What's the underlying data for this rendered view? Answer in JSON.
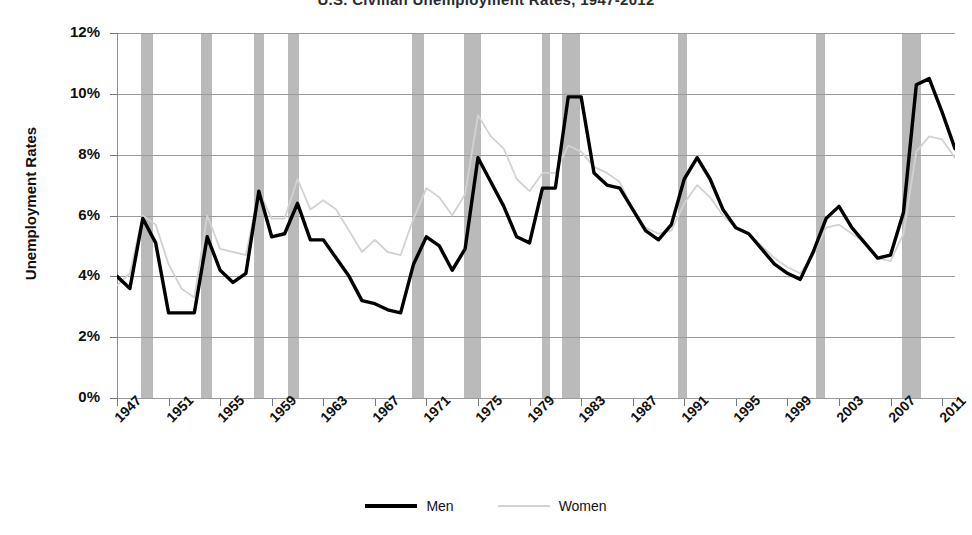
{
  "chart_data": {
    "type": "line",
    "title": "U.S. Civilian Unemployment Rates, 1947-2012",
    "xlabel": "",
    "ylabel": "Unemployment Rates",
    "ylim": [
      0,
      12
    ],
    "xlim": [
      1947,
      2012
    ],
    "grid": true,
    "legend_position": "bottom",
    "y_tick_labels": [
      "12%",
      "10%",
      "8%",
      "6%",
      "4%",
      "2%",
      "0%"
    ],
    "y_tick_values": [
      12,
      10,
      8,
      6,
      4,
      2,
      0
    ],
    "x_tick_labels": [
      "1947",
      "1951",
      "1955",
      "1959",
      "1963",
      "1967",
      "1971",
      "1975",
      "1979",
      "1983",
      "1987",
      "1991",
      "1995",
      "1999",
      "2003",
      "2007",
      "2011"
    ],
    "x_tick_values": [
      1947,
      1951,
      1955,
      1959,
      1963,
      1967,
      1971,
      1975,
      1979,
      1983,
      1987,
      1991,
      1995,
      1999,
      2003,
      2007,
      2011
    ],
    "x": [
      1947,
      1948,
      1949,
      1950,
      1951,
      1952,
      1953,
      1954,
      1955,
      1956,
      1957,
      1958,
      1959,
      1960,
      1961,
      1962,
      1963,
      1964,
      1965,
      1966,
      1967,
      1968,
      1969,
      1970,
      1971,
      1972,
      1973,
      1974,
      1975,
      1976,
      1977,
      1978,
      1979,
      1980,
      1981,
      1982,
      1983,
      1984,
      1985,
      1986,
      1987,
      1988,
      1989,
      1990,
      1991,
      1992,
      1993,
      1994,
      1995,
      1996,
      1997,
      1998,
      1999,
      2000,
      2001,
      2002,
      2003,
      2004,
      2005,
      2006,
      2007,
      2008,
      2009,
      2010,
      2011,
      2012
    ],
    "series": [
      {
        "name": "Men",
        "color": "#000000",
        "style": "thick-solid",
        "values": [
          4.0,
          3.6,
          5.9,
          5.1,
          2.8,
          2.8,
          2.8,
          5.3,
          4.2,
          3.8,
          4.1,
          6.8,
          5.3,
          5.4,
          6.4,
          5.2,
          5.2,
          4.6,
          4.0,
          3.2,
          3.1,
          2.9,
          2.8,
          4.4,
          5.3,
          5.0,
          4.2,
          4.9,
          7.9,
          7.1,
          6.3,
          5.3,
          5.1,
          6.9,
          6.9,
          9.9,
          9.9,
          7.4,
          7.0,
          6.9,
          6.2,
          5.5,
          5.2,
          5.7,
          7.2,
          7.9,
          7.2,
          6.2,
          5.6,
          5.4,
          4.9,
          4.4,
          4.1,
          3.9,
          4.8,
          5.9,
          6.3,
          5.6,
          5.1,
          4.6,
          4.7,
          6.1,
          10.3,
          10.5,
          9.4,
          8.2
        ]
      },
      {
        "name": "Women",
        "color": "#d2d2d2",
        "style": "thin-solid",
        "values": [
          3.7,
          4.1,
          6.0,
          5.7,
          4.4,
          3.6,
          3.3,
          6.0,
          4.9,
          4.8,
          4.7,
          6.8,
          5.9,
          5.9,
          7.2,
          6.2,
          6.5,
          6.2,
          5.5,
          4.8,
          5.2,
          4.8,
          4.7,
          5.9,
          6.9,
          6.6,
          6.0,
          6.7,
          9.3,
          8.6,
          8.2,
          7.2,
          6.8,
          7.4,
          7.4,
          8.3,
          8.1,
          7.6,
          7.4,
          7.1,
          6.2,
          5.6,
          5.4,
          5.5,
          6.4,
          7.0,
          6.6,
          6.0,
          5.6,
          5.4,
          5.0,
          4.6,
          4.3,
          4.1,
          4.7,
          5.6,
          5.7,
          5.4,
          5.1,
          4.6,
          4.5,
          5.4,
          8.1,
          8.6,
          8.5,
          7.9
        ]
      }
    ],
    "shaded_regions": {
      "name": "recession-bands",
      "color": "#b4b4b4",
      "periods": [
        [
          1948.9,
          1949.8
        ],
        [
          1953.5,
          1954.4
        ],
        [
          1957.6,
          1958.4
        ],
        [
          1960.3,
          1961.1
        ],
        [
          1969.9,
          1970.8
        ],
        [
          1973.9,
          1975.2
        ],
        [
          1980.0,
          1980.6
        ],
        [
          1981.5,
          1982.9
        ],
        [
          1990.5,
          1991.2
        ],
        [
          2001.2,
          2001.9
        ],
        [
          2007.9,
          2009.4
        ]
      ]
    }
  },
  "legend": {
    "items": [
      {
        "label": "Men"
      },
      {
        "label": "Women"
      }
    ]
  }
}
